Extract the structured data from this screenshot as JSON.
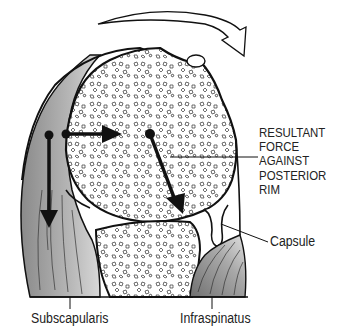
{
  "diagram": {
    "labels": {
      "resultant_force": [
        "RESULTANT",
        "FORCE",
        "AGAINST",
        "POSTERIOR",
        "RIM"
      ],
      "capsule": "Capsule",
      "subscapularis": "Subscapularis",
      "infraspinatus": "Infraspinatus"
    },
    "elements": {
      "humeral_head": "humeral-head-cancellous-bone",
      "glenoid": "glenoid-cancellous-bone",
      "rotation_arrow": "curved-rotation-arrow",
      "force_arrows": [
        "subscapularis-downward-force-arrow",
        "horizontal-compression-arrow",
        "resultant-oblique-arrow"
      ]
    },
    "colors": {
      "line": "#111111",
      "muscle_shade": "#9a9a9a",
      "background": "#ffffff"
    }
  }
}
